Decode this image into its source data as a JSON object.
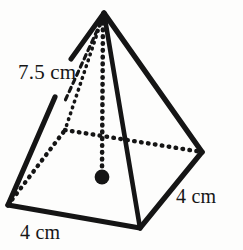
{
  "figure": {
    "name": "square-pyramid",
    "stroke_color": "#151515",
    "background_color": "#fdfdfc"
  },
  "labels": {
    "slant_height": "7.5 cm",
    "base_edge_right": "4 cm",
    "base_edge_front": "4 cm"
  },
  "geometry": {
    "apex": [
      104,
      13
    ],
    "base_front": [
      140,
      228
    ],
    "base_left": [
      8,
      205
    ],
    "base_right": [
      202,
      152
    ],
    "base_back_hidden": [
      65,
      130
    ],
    "base_center": [
      102,
      177
    ],
    "center_dot_radius": 7
  }
}
